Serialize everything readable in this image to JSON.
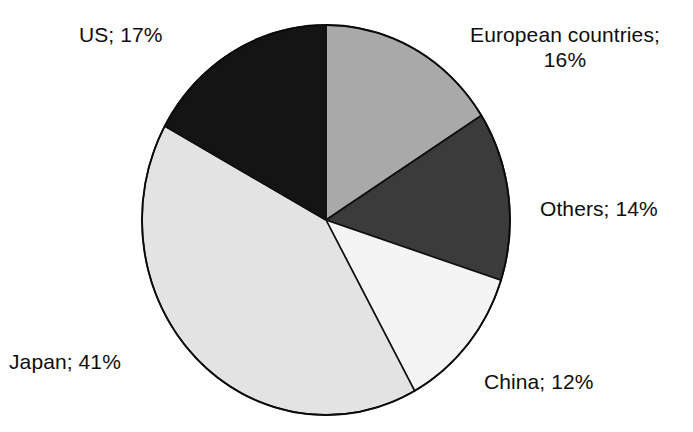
{
  "chart_data": {
    "type": "pie",
    "title": "",
    "subtitle": "",
    "xlabel": "",
    "ylabel": "",
    "legend_position": "none",
    "grid": false,
    "label_format": "name; value%",
    "categories": [
      "European countries",
      "Others",
      "China",
      "Japan",
      "US"
    ],
    "values": [
      16,
      14,
      12,
      41,
      17
    ],
    "units": "%",
    "start_angle_deg": 0,
    "direction": "clockwise",
    "slices": [
      {
        "name": "European countries",
        "value": 16,
        "label": "European countries;",
        "label_line2": "16%",
        "label_full": "European countries; 16%",
        "color": "#a9a9a9",
        "start_deg": 0,
        "end_deg": 57.6
      },
      {
        "name": "Others",
        "value": 14,
        "label": "Others; 14%",
        "label_full": "Others; 14%",
        "color": "#3b3b3b",
        "start_deg": 57.6,
        "end_deg": 108.0
      },
      {
        "name": "China",
        "value": 12,
        "label": "China; 12%",
        "label_full": "China; 12%",
        "color": "#f4f4f4",
        "start_deg": 108.0,
        "end_deg": 151.2
      },
      {
        "name": "Japan",
        "value": 41,
        "label": "Japan; 41%",
        "label_full": "Japan; 41%",
        "color": "#e3e3e3",
        "start_deg": 151.2,
        "end_deg": 298.8
      },
      {
        "name": "US",
        "value": 17,
        "label": "US; 17%",
        "label_full": "US; 17%",
        "color": "#141414",
        "start_deg": 298.8,
        "end_deg": 360.0
      }
    ],
    "stroke_color": "#000000",
    "background_color": "#ffffff"
  },
  "labels": {
    "us": "US; 17%",
    "europe_line1": "European countries;",
    "europe_line2": "16%",
    "others": "Others; 14%",
    "china": "China; 12%",
    "japan": "Japan; 41%"
  }
}
